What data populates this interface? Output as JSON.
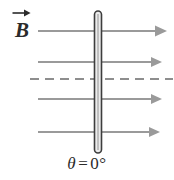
{
  "figure": {
    "title_label": "B",
    "field_vector_label": "B",
    "field_vector_accent": "vector-arrow",
    "angle": {
      "symbol": "θ",
      "equals": "=",
      "value": "0°",
      "full": "θ = 0°"
    },
    "colors": {
      "background": "#ffffff",
      "field_line": "#9a9a9a",
      "dashed_line": "#8e8e8e",
      "plate_outline": "#3a3a3a",
      "plate_fill": "#e8e8e8",
      "text": "#2b2b2b"
    },
    "plate": {
      "name": "surface-edge-on",
      "x_center": 98,
      "y_top": 11,
      "y_bottom": 153,
      "width": 7
    },
    "field_lines": [
      {
        "name": "field-line-1",
        "y": 31,
        "x_start": 38,
        "x_end": 166,
        "style": "solid",
        "arrowhead": true
      },
      {
        "name": "field-line-2",
        "y": 62,
        "x_start": 38,
        "x_end": 162,
        "style": "solid",
        "arrowhead": true
      },
      {
        "name": "normal-axis",
        "y": 79,
        "x_start": 30,
        "x_end": 172,
        "style": "dashed",
        "arrowhead": false
      },
      {
        "name": "field-line-3",
        "y": 99,
        "x_start": 38,
        "x_end": 162,
        "style": "solid",
        "arrowhead": true
      },
      {
        "name": "field-line-4",
        "y": 132,
        "x_start": 38,
        "x_end": 160,
        "style": "solid",
        "arrowhead": true
      }
    ]
  }
}
